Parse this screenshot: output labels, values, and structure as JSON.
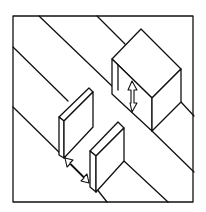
{
  "diagram": {
    "colors": {
      "stroke": "#111111",
      "background": "#ffffff"
    },
    "elements": {
      "frame": "square border",
      "blocks": [
        "upper-right block",
        "left wall slab",
        "lower-center wall slab"
      ],
      "arrows": [
        "vertical clearance arrow under upper-right block",
        "diagonal gap arrow between wall slabs"
      ]
    }
  }
}
